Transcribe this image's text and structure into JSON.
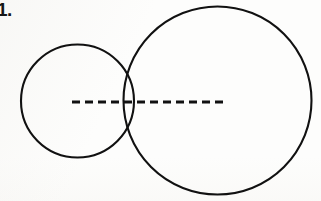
{
  "page": {
    "background_color": "#fdfdfc",
    "width": 321,
    "height": 201
  },
  "label": {
    "problem_number": "1."
  },
  "figure": {
    "ink_color": "#111111",
    "stroke_width": 2,
    "small_circle": {
      "name": "small-circle",
      "cx": 77.5,
      "cy": 101,
      "r": 56.5,
      "left": 21,
      "right": 134,
      "top": 44,
      "bottom": 158
    },
    "large_circle": {
      "name": "large-circle",
      "cx": 217.5,
      "cy": 100.5,
      "r": 94,
      "left": 123,
      "right": 311,
      "top": 7,
      "bottom": 194
    },
    "dashed_line": {
      "name": "dashed-diameter-line",
      "x1": 72,
      "x2": 223,
      "y": 102,
      "dash_pattern": "8 5",
      "stroke_width": 3
    },
    "tangent_point": {
      "x": 127,
      "y": 101
    }
  }
}
